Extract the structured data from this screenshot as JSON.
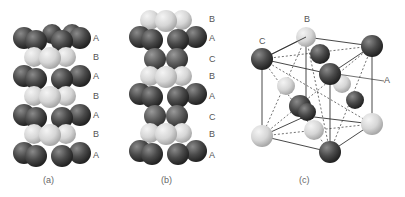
{
  "panels": [
    {
      "id": "a",
      "caption": "(a)",
      "layers": [
        "A",
        "B",
        "A",
        "B",
        "A",
        "B",
        "A"
      ]
    },
    {
      "id": "b",
      "caption": "(b)",
      "layers": [
        "B",
        "A",
        "C",
        "B",
        "A",
        "C",
        "B",
        "A"
      ]
    },
    {
      "id": "c",
      "caption": "(c)",
      "labels": {
        "top": "B",
        "left": "C",
        "right": "A"
      }
    }
  ],
  "colors": {
    "dark_atom": "#4a4a4a",
    "light_atom": "#d8d8d8",
    "label": "#555555"
  }
}
